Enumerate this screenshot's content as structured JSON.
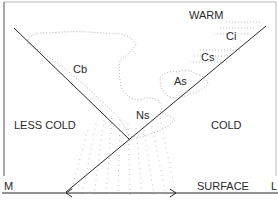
{
  "diagram": {
    "air_masses": {
      "warm": "WARM",
      "less_cold": "LESS COLD",
      "cold": "COLD"
    },
    "clouds": {
      "cb": "Cb",
      "ns": "Ns",
      "as": "As",
      "cs": "Cs",
      "ci": "Ci"
    },
    "surface": {
      "label": "SURFACE",
      "left_end": "M",
      "right_end": "L"
    },
    "colors": {
      "line": "#2a2a2a",
      "dots": "#9a9a9a",
      "frame": "#555555"
    }
  }
}
